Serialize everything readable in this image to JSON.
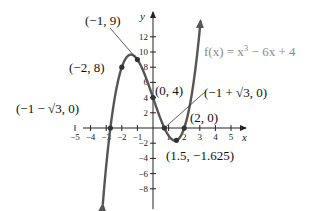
{
  "chart_data": {
    "type": "line",
    "title": "",
    "function_label": "f(x) = x³ − 6x + 4",
    "xlabel": "x",
    "ylabel": "y",
    "xlim": [
      -5.5,
      5.8
    ],
    "ylim": [
      -10,
      14
    ],
    "grid": false,
    "x_ticks": [
      -5,
      -4,
      -3,
      -2,
      -1,
      1,
      2,
      3,
      4,
      5
    ],
    "x_tick_labels": [
      "−5",
      "−4",
      "−3",
      "−2",
      "−1",
      "1",
      "2",
      "3",
      "4",
      "5"
    ],
    "y_ticks": [
      -8,
      -6,
      -4,
      -2,
      2,
      4,
      6,
      8,
      10,
      12
    ],
    "y_tick_labels": [
      "−8",
      "−6",
      "−4",
      "−2",
      "2",
      "4",
      "6",
      "8",
      "10",
      "12"
    ],
    "curve": {
      "expression": "x^3 - 6x + 4",
      "x_range": [
        -3.22,
        3.05
      ]
    },
    "points": [
      {
        "x": -2.732,
        "y": 0,
        "label": "(−1 − √3, 0)"
      },
      {
        "x": -2,
        "y": 8,
        "label": "(−2, 8)"
      },
      {
        "x": -1,
        "y": 9,
        "label": "(−1, 9)"
      },
      {
        "x": 0,
        "y": 4,
        "label": "(0, 4)"
      },
      {
        "x": 0.732,
        "y": 0,
        "label": "(−1 + √3, 0)"
      },
      {
        "x": 1.5,
        "y": -1.625,
        "label": "(1.5, −1.625)"
      },
      {
        "x": 2,
        "y": 0,
        "label": "(2, 0)"
      }
    ]
  },
  "colors": {
    "curve": "#555555",
    "axis": "#222222",
    "point": "#333333",
    "equation": "#8a8a8a"
  }
}
